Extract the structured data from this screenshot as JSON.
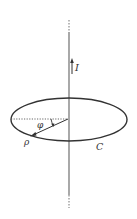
{
  "figure": {
    "labels": {
      "current": "I",
      "angle": "φ",
      "radius": "ρ",
      "curve": "C"
    },
    "colors": {
      "line": "#333333",
      "wire": "#7a7a7a",
      "background": "#ffffff"
    }
  }
}
